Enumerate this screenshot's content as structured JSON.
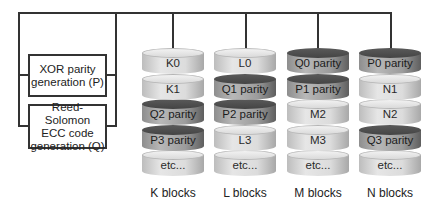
{
  "generators": {
    "xor": "XOR parity\ngeneration (P)",
    "rs": "Reed-Solomon\nECC code\ngeneration (Q)"
  },
  "stacks": [
    {
      "caption": "K blocks",
      "disks": [
        {
          "label": "K0",
          "type": "light"
        },
        {
          "label": "K1",
          "type": "light"
        },
        {
          "label": "Q2 parity",
          "type": "dark"
        },
        {
          "label": "P3 parity",
          "type": "dark"
        },
        {
          "label": "etc...",
          "type": "light"
        }
      ]
    },
    {
      "caption": "L blocks",
      "disks": [
        {
          "label": "L0",
          "type": "light"
        },
        {
          "label": "Q1 parity",
          "type": "dark"
        },
        {
          "label": "P2 parity",
          "type": "dark"
        },
        {
          "label": "L3",
          "type": "light"
        },
        {
          "label": "etc...",
          "type": "light"
        }
      ]
    },
    {
      "caption": "M blocks",
      "disks": [
        {
          "label": "Q0 parity",
          "type": "dark"
        },
        {
          "label": "P1 parity",
          "type": "dark"
        },
        {
          "label": "M2",
          "type": "light"
        },
        {
          "label": "M3",
          "type": "light"
        },
        {
          "label": "etc...",
          "type": "light"
        }
      ]
    },
    {
      "caption": "N blocks",
      "disks": [
        {
          "label": "P0 parity",
          "type": "dark"
        },
        {
          "label": "N1",
          "type": "light"
        },
        {
          "label": "N2",
          "type": "light"
        },
        {
          "label": "Q3 parity",
          "type": "dark"
        },
        {
          "label": "etc...",
          "type": "light"
        }
      ]
    }
  ]
}
